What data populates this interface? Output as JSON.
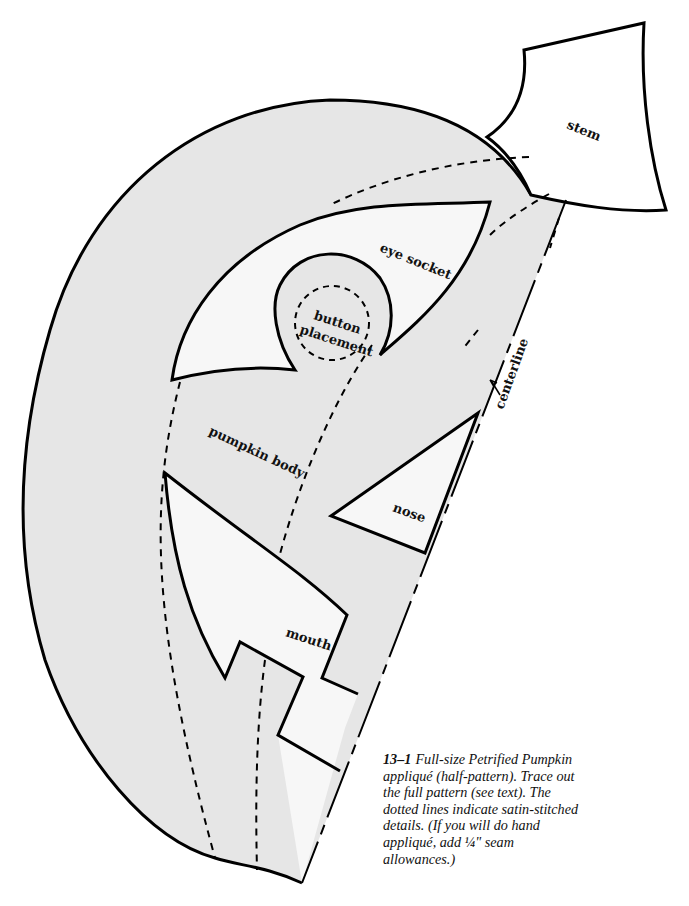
{
  "figure": {
    "number": "13–1",
    "caption": "Full-size Petrified Pumpkin appliqué (half-pattern). Trace out the full pattern (see text). The dotted lines indicate satin-stitched details. (If you will do hand appliqué, add ¼\" seam allowances.)"
  },
  "pieces": {
    "stem": "stem",
    "eye_socket": "eye socket",
    "button_line1": "button",
    "button_line2": "placement",
    "pumpkin_body": "pumpkin body",
    "nose": "nose",
    "mouth": "mouth",
    "centerline": "centerline"
  },
  "colors": {
    "body_fill": "#e6e6e6",
    "cutout_fill": "#f7f7f7",
    "stroke": "#000000"
  }
}
